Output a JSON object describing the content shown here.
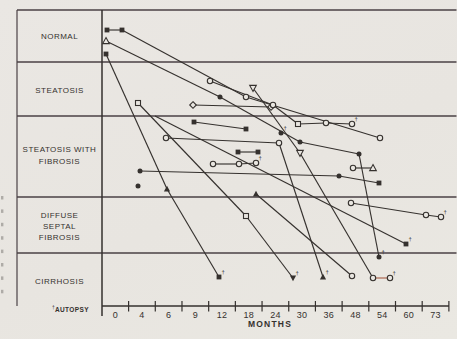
{
  "figure": {
    "stage_labels": [
      [
        "NORMAL"
      ],
      [
        "STEATOSIS"
      ],
      [
        "STEATOSIS WITH",
        "FIBROSIS"
      ],
      [
        "DIFFUSE",
        "SEPTAL",
        "FIBROSIS"
      ],
      [
        "CIRRHOSIS"
      ]
    ],
    "x_tick_labels": [
      "0",
      "4",
      "6",
      "9",
      "12",
      "18",
      "24",
      "30",
      "36",
      "48",
      "54",
      "60",
      "73"
    ],
    "x_axis_label": "MONTHS",
    "footnote_dagger": "†",
    "footnote_text": "AUTOPSY"
  },
  "colors": {
    "paper": "#e9e6e1",
    "ink": "#35312e",
    "rule": "#4a4145",
    "red": "#a8604a"
  },
  "chart_data": {
    "type": "line",
    "title": "",
    "xlabel": "MONTHS",
    "x_scale": "ordinal",
    "x_tick_values": [
      0,
      4,
      6,
      9,
      12,
      18,
      24,
      30,
      36,
      48,
      54,
      60,
      73
    ],
    "stages": [
      "NORMAL",
      "STEATOSIS",
      "STEATOSIS WITH FIBROSIS",
      "DIFFUSE SEPTAL FIBROSIS",
      "CIRRHOSIS"
    ],
    "footnote": "† AUTOPSY",
    "legend": "each polyline is one patient followed over serial biopsies; y position = histologic stage, x = months",
    "series": [
      {
        "name": "patient-01",
        "points": [
          {
            "month": 0,
            "stage": "NORMAL",
            "marker": "filled-square",
            "autopsy": false,
            "px": [
              107,
              30
            ]
          },
          {
            "month": 1,
            "stage": "NORMAL",
            "marker": "filled-square",
            "autopsy": false,
            "px": [
              122,
              30
            ]
          },
          {
            "month": 17,
            "stage": "STEATOSIS",
            "marker": "open-circle",
            "autopsy": false,
            "px": [
              246,
              97
            ]
          },
          {
            "month": 53,
            "stage": "STEATOSIS WITH FIBROSIS",
            "marker": "open-circle",
            "autopsy": false,
            "px": [
              380,
              138
            ]
          }
        ]
      },
      {
        "name": "patient-02",
        "points": [
          {
            "month": 0,
            "stage": "NORMAL",
            "marker": "open-triangle-up",
            "autopsy": false,
            "px": [
              106,
              41
            ]
          },
          {
            "month": 12,
            "stage": "STEATOSIS",
            "marker": "filled-circle",
            "autopsy": false,
            "px": [
              220,
              97
            ]
          },
          {
            "month": 29,
            "stage": "STEATOSIS WITH FIBROSIS",
            "marker": "filled-circle",
            "autopsy": false,
            "px": [
              300,
              142
            ]
          },
          {
            "month": 49,
            "stage": "STEATOSIS WITH FIBROSIS",
            "marker": "filled-circle",
            "autopsy": false,
            "px": [
              359,
              154
            ]
          },
          {
            "month": 53,
            "stage": "CIRRHOSIS",
            "marker": "filled-circle",
            "autopsy": true,
            "px": [
              379,
              257
            ]
          }
        ]
      },
      {
        "name": "patient-03",
        "points": [
          {
            "month": 0,
            "stage": "NORMAL",
            "marker": "filled-square",
            "autopsy": false,
            "px": [
              106,
              54
            ]
          },
          {
            "month": 6,
            "stage": "STEATOSIS WITH FIBROSIS",
            "marker": "filled-triangle-up",
            "autopsy": false,
            "px": [
              167,
              189
            ]
          },
          {
            "month": 12,
            "stage": "CIRRHOSIS",
            "marker": "filled-square",
            "autopsy": true,
            "px": [
              219,
              277
            ]
          }
        ]
      },
      {
        "name": "patient-04",
        "points": [
          {
            "month": 3,
            "stage": "STEATOSIS",
            "marker": "open-square",
            "autopsy": false,
            "px": [
              138,
              103
            ]
          },
          {
            "month": 17,
            "stage": "DIFFUSE SEPTAL FIBROSIS",
            "marker": "open-square",
            "autopsy": false,
            "px": [
              246,
              216
            ]
          },
          {
            "month": 28,
            "stage": "CIRRHOSIS",
            "marker": "filled-triangle-down",
            "autopsy": true,
            "px": [
              293,
              278
            ]
          }
        ]
      },
      {
        "name": "patient-05",
        "points": [
          {
            "month": 5,
            "stage": "STEATOSIS WITH FIBROSIS",
            "marker": "none",
            "autopsy": false,
            "px": [
              155,
              116
            ]
          },
          {
            "month": 59,
            "stage": "DIFFUSE SEPTAL FIBROSIS",
            "marker": "filled-square",
            "autopsy": true,
            "px": [
              406,
              244
            ]
          }
        ]
      },
      {
        "name": "patient-06",
        "points": [
          {
            "month": 9,
            "stage": "STEATOSIS",
            "marker": "open-diamond",
            "autopsy": false,
            "px": [
              193,
              105
            ]
          },
          {
            "month": 23,
            "stage": "STEATOSIS",
            "marker": "open-diamond",
            "autopsy": false,
            "px": [
              271,
              107
            ]
          }
        ]
      },
      {
        "name": "patient-07",
        "points": [
          {
            "month": 11,
            "stage": "STEATOSIS",
            "marker": "open-circle",
            "autopsy": false,
            "px": [
              210,
              81
            ]
          },
          {
            "month": 23,
            "stage": "STEATOSIS",
            "marker": "open-circle",
            "autopsy": false,
            "px": [
              273,
              105
            ]
          },
          {
            "month": 29,
            "stage": "STEATOSIS WITH FIBROSIS",
            "marker": "open-square",
            "autopsy": false,
            "px": [
              298,
              124
            ]
          },
          {
            "month": 36,
            "stage": "STEATOSIS WITH FIBROSIS",
            "marker": "open-circle",
            "autopsy": false,
            "px": [
              326,
              123
            ]
          },
          {
            "month": 46,
            "stage": "STEATOSIS WITH FIBROSIS",
            "marker": "open-circle",
            "autopsy": true,
            "px": [
              352,
              124
            ]
          }
        ]
      },
      {
        "name": "patient-08",
        "segment_colors": [
          "ink",
          "ink",
          "red"
        ],
        "points": [
          {
            "month": 19,
            "stage": "STEATOSIS",
            "marker": "open-triangle-down",
            "autopsy": false,
            "px": [
              253,
              88
            ]
          },
          {
            "month": 29,
            "stage": "STEATOSIS WITH FIBROSIS",
            "marker": "open-triangle-down",
            "autopsy": false,
            "px": [
              300,
              153
            ]
          },
          {
            "month": 52,
            "stage": "CIRRHOSIS",
            "marker": "open-circle",
            "autopsy": false,
            "px": [
              373,
              278
            ]
          },
          {
            "month": 56,
            "stage": "CIRRHOSIS",
            "marker": "open-circle",
            "autopsy": true,
            "px": [
              390,
              278
            ]
          }
        ]
      },
      {
        "name": "patient-09",
        "points": [
          {
            "month": 6,
            "stage": "STEATOSIS WITH FIBROSIS",
            "marker": "open-circle",
            "autopsy": false,
            "px": [
              166,
              138
            ]
          },
          {
            "month": 25,
            "stage": "STEATOSIS WITH FIBROSIS",
            "marker": "open-circle",
            "autopsy": false,
            "px": [
              279,
              143
            ]
          },
          {
            "month": 35,
            "stage": "CIRRHOSIS",
            "marker": "filled-triangle-up",
            "autopsy": true,
            "px": [
              323,
              277
            ]
          }
        ]
      },
      {
        "name": "patient-10",
        "points": [
          {
            "month": 9,
            "stage": "STEATOSIS WITH FIBROSIS",
            "marker": "filled-square",
            "autopsy": false,
            "px": [
              194,
              122
            ]
          },
          {
            "month": 17,
            "stage": "STEATOSIS WITH FIBROSIS",
            "marker": "filled-square",
            "autopsy": false,
            "px": [
              246,
              129
            ]
          }
        ]
      },
      {
        "name": "patient-11",
        "points": [
          {
            "month": 15,
            "stage": "STEATOSIS WITH FIBROSIS",
            "marker": "filled-square",
            "autopsy": false,
            "px": [
              238,
              152
            ]
          },
          {
            "month": 20,
            "stage": "STEATOSIS WITH FIBROSIS",
            "marker": "filled-square",
            "autopsy": false,
            "px": [
              258,
              152
            ]
          }
        ]
      },
      {
        "name": "patient-12",
        "points": [
          {
            "month": 11,
            "stage": "STEATOSIS WITH FIBROSIS",
            "marker": "open-circle",
            "autopsy": false,
            "px": [
              213,
              164
            ]
          },
          {
            "month": 15,
            "stage": "STEATOSIS WITH FIBROSIS",
            "marker": "open-circle",
            "autopsy": false,
            "px": [
              239,
              164
            ]
          },
          {
            "month": 19,
            "stage": "STEATOSIS WITH FIBROSIS",
            "marker": "open-circle",
            "autopsy": true,
            "px": [
              256,
              163
            ]
          }
        ]
      },
      {
        "name": "patient-13",
        "points": [
          {
            "month": 3,
            "stage": "STEATOSIS WITH FIBROSIS",
            "marker": "filled-circle",
            "autopsy": false,
            "px": [
              140,
              171
            ]
          },
          {
            "month": 41,
            "stage": "STEATOSIS WITH FIBROSIS",
            "marker": "filled-circle",
            "autopsy": false,
            "px": [
              339,
              176
            ]
          },
          {
            "month": 53,
            "stage": "STEATOSIS WITH FIBROSIS",
            "marker": "filled-square",
            "autopsy": false,
            "px": [
              379,
              183
            ]
          }
        ]
      },
      {
        "name": "patient-14",
        "points": [
          {
            "month": 3,
            "stage": "STEATOSIS WITH FIBROSIS",
            "marker": "filled-circle",
            "autopsy": false,
            "px": [
              138,
              186
            ]
          }
        ]
      },
      {
        "name": "patient-15",
        "points": [
          {
            "month": 25,
            "stage": "STEATOSIS WITH FIBROSIS",
            "marker": "filled-circle",
            "autopsy": true,
            "px": [
              281,
              133
            ]
          }
        ]
      },
      {
        "name": "patient-16",
        "points": [
          {
            "month": 46,
            "stage": "DIFFUSE SEPTAL FIBROSIS",
            "marker": "open-circle",
            "autopsy": false,
            "px": [
              351,
              203
            ]
          },
          {
            "month": 69,
            "stage": "DIFFUSE SEPTAL FIBROSIS",
            "marker": "open-circle",
            "autopsy": false,
            "px": [
              426,
              215
            ]
          },
          {
            "month": 75,
            "stage": "DIFFUSE SEPTAL FIBROSIS",
            "marker": "open-circle",
            "autopsy": true,
            "px": [
              441,
              217
            ]
          }
        ]
      },
      {
        "name": "patient-17",
        "points": [
          {
            "month": 19,
            "stage": "STEATOSIS WITH FIBROSIS",
            "marker": "filled-triangle-up",
            "autopsy": false,
            "px": [
              256,
              194
            ]
          },
          {
            "month": 46,
            "stage": "CIRRHOSIS",
            "marker": "open-circle",
            "autopsy": false,
            "px": [
              352,
              276
            ]
          }
        ]
      },
      {
        "name": "patient-18",
        "points": [
          {
            "month": 46,
            "stage": "STEATOSIS WITH FIBROSIS",
            "marker": "open-circle",
            "autopsy": false,
            "px": [
              353,
              168
            ]
          },
          {
            "month": 52,
            "stage": "STEATOSIS WITH FIBROSIS",
            "marker": "open-triangle-up",
            "autopsy": false,
            "px": [
              373,
              168
            ]
          }
        ]
      }
    ]
  }
}
